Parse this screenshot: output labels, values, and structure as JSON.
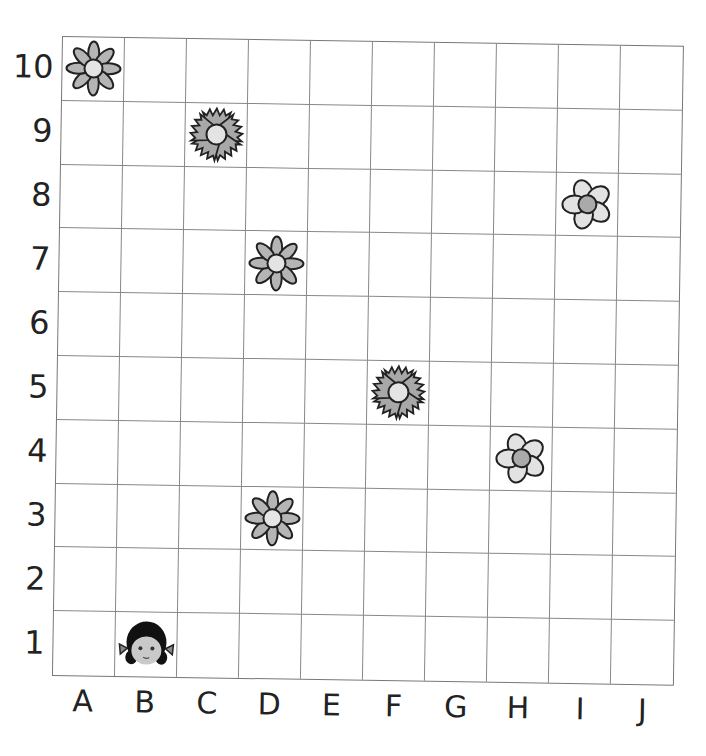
{
  "grid": {
    "columns": [
      "A",
      "B",
      "C",
      "D",
      "E",
      "F",
      "G",
      "H",
      "I",
      "J"
    ],
    "rows": [
      "10",
      "9",
      "8",
      "7",
      "6",
      "5",
      "4",
      "3",
      "2",
      "1"
    ],
    "colors": {
      "line": "#888888",
      "petal": "#b5b5b5",
      "center": "#e4e4e4",
      "outline": "#222222"
    }
  },
  "items": [
    {
      "type": "daisy-flower",
      "col": "A",
      "row": "10"
    },
    {
      "type": "carnation-flower",
      "col": "C",
      "row": "9"
    },
    {
      "type": "five-petal-flower",
      "col": "I",
      "row": "8"
    },
    {
      "type": "daisy-flower",
      "col": "D",
      "row": "7"
    },
    {
      "type": "carnation-flower",
      "col": "F",
      "row": "5"
    },
    {
      "type": "five-petal-flower",
      "col": "H",
      "row": "4"
    },
    {
      "type": "daisy-flower",
      "col": "D",
      "row": "3"
    },
    {
      "type": "girl-face",
      "col": "B",
      "row": "1"
    }
  ]
}
